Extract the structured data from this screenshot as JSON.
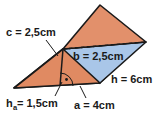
{
  "figure": {
    "shape_name": "triangular-prism",
    "colors": {
      "face_orange": "#E08A62",
      "face_orange_top": "#E2906B",
      "face_blue": "#A9C6E8",
      "outline": "#1a1a1a",
      "background": "#ffffff",
      "label_text": "#1a1a1a"
    },
    "labels": [
      {
        "id": "c",
        "text": "c = 2,5cm",
        "symbol": "c",
        "value": "2,5",
        "unit": "cm",
        "role": "slant-edge-left",
        "x": 6,
        "y": 33
      },
      {
        "id": "b",
        "text": "b = 2,5cm",
        "symbol": "b",
        "value": "2,5",
        "unit": "cm",
        "role": "triangle-side-b",
        "x": 73,
        "y": 57
      },
      {
        "id": "h",
        "text": "h = 6cm",
        "symbol": "h",
        "value": "6",
        "unit": "cm",
        "role": "prism-length",
        "x": 111,
        "y": 80
      },
      {
        "id": "ha",
        "text": "h",
        "sub": "a",
        "rest": " = 1,5cm",
        "symbol": "h_a",
        "value": "1,5",
        "unit": "cm",
        "role": "triangle-height",
        "x": 6,
        "y": 104
      },
      {
        "id": "a",
        "text": "a = 4cm",
        "symbol": "a",
        "value": "4",
        "unit": "cm",
        "role": "triangle-base",
        "x": 74,
        "y": 106
      }
    ],
    "markers": {
      "right_angle": "right-angle-dot-arc"
    }
  }
}
